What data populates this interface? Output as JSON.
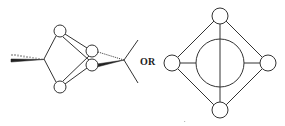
{
  "diagram": {
    "connector_label": "OR",
    "colors": {
      "stroke": "#333333",
      "fill": "#ffffff",
      "text": "#222222"
    },
    "left_structure": {
      "description": "3D wedge/hash perspective cluster",
      "nodes": [
        {
          "id": "top",
          "cx": 60,
          "cy": 31,
          "r": 6
        },
        {
          "id": "bottom",
          "cx": 60,
          "cy": 87,
          "r": 6
        },
        {
          "id": "right-upper",
          "cx": 92,
          "cy": 51,
          "r": 6
        },
        {
          "id": "right-lower",
          "cx": 92,
          "cy": 65,
          "r": 6
        }
      ],
      "vertices": [
        {
          "id": "left-apex",
          "x": 44,
          "y": 59
        },
        {
          "id": "right-apex",
          "x": 124,
          "y": 60
        }
      ]
    },
    "right_structure": {
      "description": "planar diamond cluster with central ring",
      "nodes": [
        {
          "id": "top",
          "cx": 220,
          "cy": 16,
          "r": 8
        },
        {
          "id": "left",
          "cx": 172,
          "cy": 63,
          "r": 8
        },
        {
          "id": "right",
          "cx": 268,
          "cy": 63,
          "r": 8
        },
        {
          "id": "bottom",
          "cx": 220,
          "cy": 110,
          "r": 8
        },
        {
          "id": "center",
          "cx": 220,
          "cy": 63,
          "r": 24
        }
      ]
    }
  }
}
